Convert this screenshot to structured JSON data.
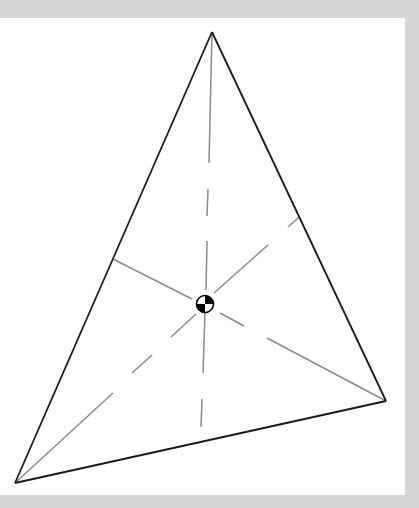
{
  "diagram": {
    "colors": {
      "background": "#d6d6d6",
      "panel": "#ffffff",
      "edge": "#1a1a1a",
      "median": "#8a8a8a",
      "centroid_fill": "#000000"
    },
    "vertices": [
      {
        "id": "A",
        "label": "top-vertex"
      },
      {
        "id": "B",
        "label": "bottom-left-vertex"
      },
      {
        "id": "C",
        "label": "right-vertex"
      }
    ],
    "edges": [
      {
        "from": "A",
        "to": "B"
      },
      {
        "from": "B",
        "to": "C"
      },
      {
        "from": "C",
        "to": "A"
      }
    ],
    "medians": [
      {
        "from": "A",
        "to_midpoint_of": "BC",
        "style": "solid-then-dashed"
      },
      {
        "from": "B",
        "to_midpoint_of": "CA",
        "style": "solid-then-dashed"
      },
      {
        "from": "C",
        "to_midpoint_of": "AB",
        "style": "solid-then-dashed"
      }
    ],
    "centroid": {
      "symbol": "center-of-mass"
    }
  }
}
